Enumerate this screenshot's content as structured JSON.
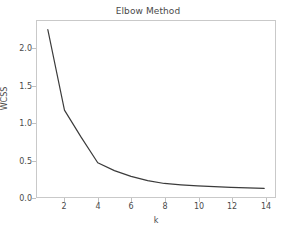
{
  "figure": {
    "title": "Elbow Method",
    "background_color": "#ffffff",
    "frame_color": "#c9c9c9",
    "line_color": "#3b3b3b",
    "text_color": "#4a4a4a"
  },
  "axes": {
    "xlabel": "k",
    "ylabel": "WCSS",
    "xticks": [
      "2",
      "4",
      "6",
      "8",
      "10",
      "12",
      "14"
    ],
    "yticks": [
      "0.0",
      "0.5",
      "1.0",
      "1.5",
      "2.0"
    ]
  },
  "chart_data": {
    "type": "line",
    "title": "Elbow Method",
    "xlabel": "k",
    "ylabel": "WCSS",
    "x": [
      1,
      2,
      3,
      4,
      5,
      6,
      7,
      8,
      9,
      10,
      11,
      12,
      13,
      14
    ],
    "values": [
      2.24,
      1.11,
      0.73,
      0.37,
      0.26,
      0.18,
      0.12,
      0.08,
      0.06,
      0.045,
      0.035,
      0.025,
      0.018,
      0.01
    ],
    "series": [
      {
        "name": "WCSS",
        "values": [
          2.24,
          1.11,
          0.73,
          0.37,
          0.26,
          0.18,
          0.12,
          0.08,
          0.06,
          0.045,
          0.035,
          0.025,
          0.018,
          0.01
        ]
      }
    ],
    "xlim": [
      0.35,
      14.65
    ],
    "ylim": [
      -0.11,
      2.36
    ],
    "xticks": [
      2,
      4,
      6,
      8,
      10,
      12,
      14
    ],
    "yticks": [
      0.0,
      0.5,
      1.0,
      1.5,
      2.0
    ],
    "grid": false,
    "legend": false,
    "line_color": "#3b3b3b",
    "line_width": 1.2,
    "markers": false
  }
}
